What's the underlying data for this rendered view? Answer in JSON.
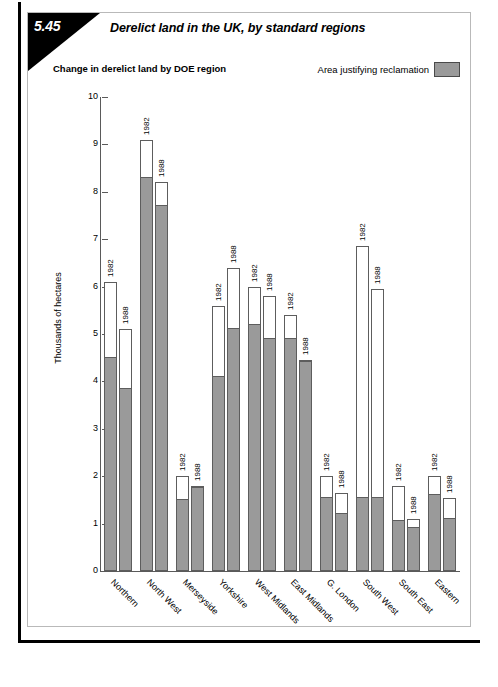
{
  "header": {
    "number": "5.45",
    "title": "Derelict land in the UK, by standard regions"
  },
  "subtitle": "Change in derelict land by DOE region",
  "legend": {
    "label": "Area justifying reclamation",
    "swatch_color": "#9a9a9a"
  },
  "chart_data": {
    "type": "bar",
    "title": "Change in derelict land by DOE region",
    "subtype": "grouped-stacked",
    "xlabel": "",
    "ylabel": "Thousands of hectares",
    "ylim": [
      0,
      10
    ],
    "yticks": [
      0,
      1,
      2,
      3,
      4,
      5,
      6,
      7,
      8,
      9,
      10
    ],
    "ytick_labels": [
      "0",
      "1",
      "2",
      "3",
      "4",
      "5",
      "6",
      "7",
      "8",
      "9",
      "10"
    ],
    "grid": false,
    "legend_position": "top-right",
    "categories": [
      "Northern",
      "North West",
      "Merseyside",
      "Yorkshire",
      "West Midlands",
      "East Midlands",
      "G. London",
      "South West",
      "South East",
      "Eastern"
    ],
    "year_labels": [
      "1982",
      "1988"
    ],
    "series": [
      {
        "name": "Total derelict land (outline, 1982)",
        "year": "1982",
        "values": [
          6.1,
          9.1,
          2.0,
          5.6,
          6.0,
          5.4,
          2.0,
          6.85,
          1.8,
          2.0
        ]
      },
      {
        "name": "Area justifying reclamation (shaded, 1982)",
        "year": "1982",
        "values": [
          4.5,
          8.3,
          1.5,
          4.1,
          5.2,
          4.9,
          1.55,
          1.55,
          1.05,
          1.6
        ]
      },
      {
        "name": "Total derelict land (outline, 1988)",
        "year": "1988",
        "values": [
          5.1,
          8.2,
          1.8,
          6.4,
          5.8,
          4.45,
          1.65,
          5.95,
          1.1,
          1.55
        ]
      },
      {
        "name": "Area justifying reclamation (shaded, 1988)",
        "year": "1988",
        "values": [
          3.85,
          7.7,
          1.75,
          5.1,
          4.9,
          4.4,
          1.2,
          1.55,
          0.9,
          1.1
        ]
      }
    ]
  }
}
